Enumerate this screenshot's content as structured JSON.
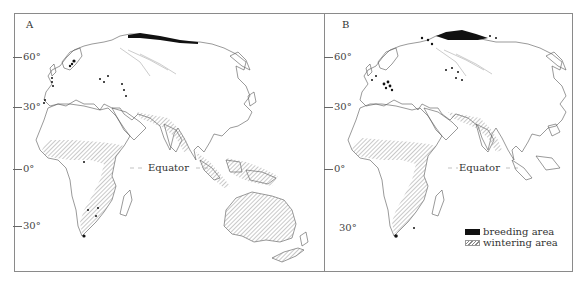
{
  "figure": {
    "panels": [
      {
        "id": "A",
        "label": "A",
        "latitude_labels": [
          "60°",
          "30°",
          "0°",
          "30°"
        ],
        "equator_label": "Equator"
      },
      {
        "id": "B",
        "label": "B",
        "latitude_labels": [
          "60°",
          "30°",
          "0°",
          "30°"
        ],
        "equator_label": "Equator"
      }
    ],
    "legend": {
      "items": [
        {
          "label": "breeding area",
          "swatch": "solid-black",
          "color": "#111111"
        },
        {
          "label": "wintering area",
          "swatch": "hatched",
          "color": "#888888"
        }
      ]
    },
    "colors": {
      "coastline": "#555555",
      "breeding": "#111111",
      "hatch": "#777777",
      "frame": "#8a8a8a"
    }
  }
}
